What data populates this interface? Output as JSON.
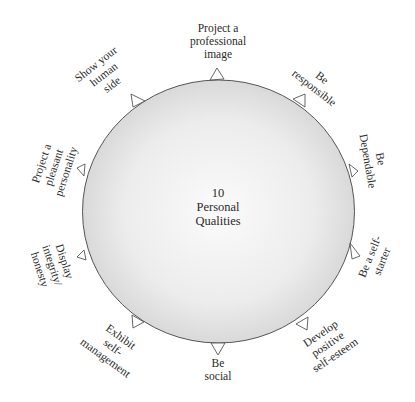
{
  "diagram": {
    "center": {
      "line1": "10",
      "line2": "Personal",
      "line3": "Qualities"
    },
    "colors": {
      "circle_fill_center": "#fafafa",
      "circle_fill_edge": "#dcdcdc",
      "stroke": "#555555",
      "text": "#2a2a2a"
    },
    "qualities": [
      {
        "lines": [
          "Project a",
          "professional",
          "image"
        ]
      },
      {
        "lines": [
          "Be",
          "responsible"
        ]
      },
      {
        "lines": [
          "Be",
          "Dependable"
        ]
      },
      {
        "lines": [
          "Be a self-",
          "starter"
        ]
      },
      {
        "lines": [
          "Develop",
          "positive",
          "self-esteem"
        ]
      },
      {
        "lines": [
          "Be",
          "social"
        ]
      },
      {
        "lines": [
          "Exhibit",
          "self-",
          "management"
        ]
      },
      {
        "lines": [
          "Display",
          "integrity/",
          "honesty"
        ]
      },
      {
        "lines": [
          "Project a",
          "pleasant",
          "personality"
        ]
      },
      {
        "lines": [
          "Show your",
          "human",
          "side"
        ]
      }
    ]
  }
}
